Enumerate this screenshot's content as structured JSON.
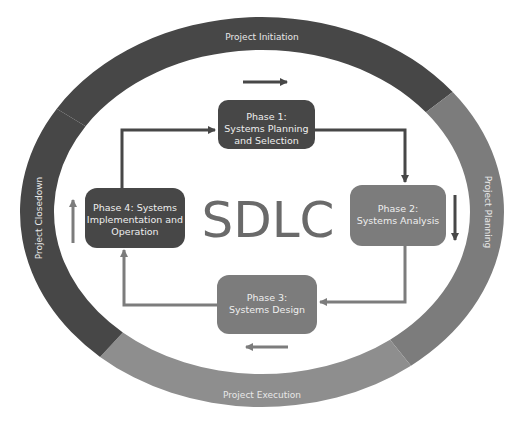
{
  "title": "SDLC",
  "colors": {
    "dark": "#474747",
    "medium": "#7c7c7c",
    "light_medium": "#8e8e8e",
    "sdlc_text": "#6a6a6a"
  },
  "ring_segments": [
    {
      "id": "initiation",
      "label": "Project Initiation",
      "shade": "dark"
    },
    {
      "id": "planning",
      "label": "Project Planning",
      "shade": "medium"
    },
    {
      "id": "execution",
      "label": "Project Execution",
      "shade": "light_medium"
    },
    {
      "id": "closedown",
      "label": "Project Closedown",
      "shade": "dark"
    }
  ],
  "phases": [
    {
      "id": "phase1",
      "lines": [
        "Phase 1:",
        "Systems Planning",
        "and Selection"
      ],
      "shade": "dark"
    },
    {
      "id": "phase2",
      "lines": [
        "Phase 2:",
        "Systems Analysis"
      ],
      "shade": "medium"
    },
    {
      "id": "phase3",
      "lines": [
        "Phase 3:",
        "Systems Design"
      ],
      "shade": "medium"
    },
    {
      "id": "phase4",
      "lines": [
        "Phase 4: Systems",
        "Implementation and",
        "Operation"
      ],
      "shade": "dark"
    }
  ],
  "flow": [
    "phase1 -> phase2",
    "phase2 -> phase3",
    "phase3 -> phase4",
    "phase4 -> phase1"
  ],
  "direction_arrows": [
    "right (top)",
    "down (right)",
    "left (bottom)",
    "up (left)"
  ]
}
